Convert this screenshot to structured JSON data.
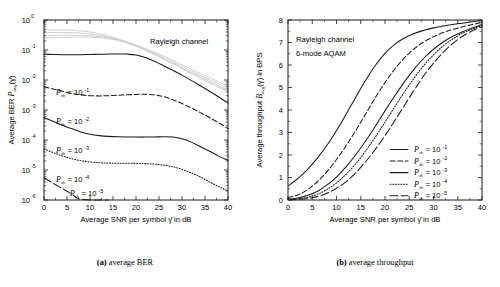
{
  "figure": {
    "panels": [
      {
        "id": "a",
        "caption_tag": "(a)",
        "caption_text": " average BER",
        "annotations": [
          "Rayleigh channel"
        ],
        "chart_data": {
          "type": "line",
          "title": "",
          "xlabel": "Average SNR per symbol γ̄  in dB",
          "ylabel": "Average BER Pₐᵥᵍ(γ̄)",
          "xlim": [
            0,
            40
          ],
          "ylim": [
            1e-06,
            1
          ],
          "yscale": "log",
          "grid": false,
          "xticks": [
            0,
            5,
            10,
            15,
            20,
            25,
            30,
            35,
            40
          ],
          "xticklabels": [
            "0",
            "5",
            "10",
            "15",
            "20",
            "25",
            "30",
            "35",
            "40"
          ],
          "yticks": [
            1,
            0.1,
            0.01,
            0.001,
            0.0001,
            1e-05,
            1e-06
          ],
          "yticklabels": [
            "10^0",
            "10^-1",
            "10^-2",
            "10^-3",
            "10^-4",
            "10^-5",
            "10^-6"
          ],
          "legend_position": "inline-labels",
          "series": [
            {
              "name": "Pth = 10^-1",
              "label_base": "P",
              "label_sub": "th",
              "label_eq": "= 10",
              "label_exp": "-1",
              "style": "solid",
              "x": [
                0,
                2,
                4,
                6,
                8,
                10,
                12,
                14,
                16,
                18,
                20,
                22,
                24,
                26,
                28,
                30,
                32,
                34,
                36,
                38,
                40
              ],
              "y": [
                0.072,
                0.071,
                0.07,
                0.07,
                0.07,
                0.071,
                0.072,
                0.073,
                0.074,
                0.073,
                0.068,
                0.056,
                0.042,
                0.03,
                0.021,
                0.0145,
                0.0097,
                0.0064,
                0.0042,
                0.0027,
                0.0017
              ]
            },
            {
              "name": "Pth = 10^-2",
              "label_base": "P",
              "label_sub": "th",
              "label_eq": "= 10",
              "label_exp": "-2",
              "style": "dashed",
              "x": [
                0,
                2,
                4,
                6,
                8,
                10,
                12,
                14,
                16,
                18,
                20,
                22,
                24,
                26,
                28,
                30,
                32,
                34,
                36,
                38,
                40
              ],
              "y": [
                0.006,
                0.005,
                0.0042,
                0.0036,
                0.0032,
                0.003,
                0.00295,
                0.003,
                0.0031,
                0.0032,
                0.0033,
                0.00335,
                0.0032,
                0.0028,
                0.0022,
                0.00165,
                0.00118,
                0.00082,
                0.00056,
                0.00037,
                0.00024
              ]
            },
            {
              "name": "Pth = 10^-3",
              "label_base": "P",
              "label_sub": "th",
              "label_eq": "= 10",
              "label_exp": "-3",
              "style": "solid",
              "x": [
                0,
                2,
                4,
                6,
                8,
                10,
                12,
                14,
                16,
                18,
                20,
                22,
                24,
                26,
                28,
                30,
                32,
                34,
                36,
                38,
                40
              ],
              "y": [
                0.00056,
                0.00042,
                0.00031,
                0.00024,
                0.000185,
                0.000155,
                0.00014,
                0.000132,
                0.000128,
                0.000126,
                0.000125,
                0.000125,
                0.000126,
                0.000128,
                0.000125,
                0.00011,
                8.5e-05,
                6e-05,
                4.2e-05,
                2.9e-05,
                2.1e-05
              ]
            },
            {
              "name": "Pth = 10^-4",
              "label_base": "P",
              "label_sub": "th",
              "label_eq": "= 10",
              "label_exp": "-4",
              "style": "dotted",
              "x": [
                0,
                2,
                4,
                6,
                8,
                10,
                12,
                14,
                16,
                18,
                20,
                22,
                24,
                26,
                28,
                30,
                32,
                34,
                36,
                38,
                40
              ],
              "y": [
                5e-05,
                3.8e-05,
                2.95e-05,
                2.4e-05,
                2.05e-05,
                1.85e-05,
                1.75e-05,
                1.7e-05,
                1.68e-05,
                1.67e-05,
                1.66e-05,
                1.63e-05,
                1.57e-05,
                1.45e-05,
                1.28e-05,
                1.05e-05,
                8e-06,
                5.8e-06,
                4e-06,
                2.8e-06,
                2e-06
              ]
            },
            {
              "name": "Pth = 10^-5",
              "label_base": "P",
              "label_sub": "th",
              "label_eq": "= 10",
              "label_exp": "-5",
              "style": "longdash",
              "x": [
                0,
                2,
                4,
                6,
                8,
                10,
                12,
                14
              ],
              "y": [
                5.5e-06,
                3.6e-06,
                2.4e-06,
                1.6e-06,
                1.05e-06,
                7e-07,
                4.6e-07,
                1e-06
              ]
            }
          ]
        }
      },
      {
        "id": "b",
        "caption_tag": "(b)",
        "caption_text": " average throughput",
        "annotations": [
          "Rayleigh channel",
          "6-mode AQAM"
        ],
        "chart_data": {
          "type": "line",
          "title": "",
          "xlabel": "Average SNR per symbol γ̄  in dB",
          "ylabel": "Average throughput Bₐᵥᵍ(γ̄) in BPS",
          "xlim": [
            0,
            40
          ],
          "ylim": [
            0,
            8
          ],
          "yscale": "linear",
          "grid": false,
          "xticks": [
            0,
            5,
            10,
            15,
            20,
            25,
            30,
            35,
            40
          ],
          "xticklabels": [
            "0",
            "5",
            "10",
            "15",
            "20",
            "25",
            "30",
            "35",
            "40"
          ],
          "yticks": [
            0,
            1,
            2,
            3,
            4,
            5,
            6,
            7,
            8
          ],
          "yticklabels": [
            "0",
            "1",
            "2",
            "3",
            "4",
            "5",
            "6",
            "7",
            "8"
          ],
          "legend_position": "lower-right",
          "series": [
            {
              "name": "Pth = 10^-1",
              "label_base": "P",
              "label_sub": "th",
              "label_eq": "= 10",
              "label_exp": "-1",
              "style": "solid",
              "x": [
                0,
                2,
                4,
                6,
                8,
                10,
                12,
                14,
                16,
                18,
                20,
                22,
                24,
                26,
                28,
                30,
                32,
                34,
                36,
                38,
                40
              ],
              "y": [
                0.62,
                0.95,
                1.35,
                1.85,
                2.42,
                3.08,
                3.82,
                4.58,
                5.32,
                5.98,
                6.52,
                6.92,
                7.2,
                7.4,
                7.54,
                7.65,
                7.73,
                7.8,
                7.86,
                7.92,
                7.97
              ]
            },
            {
              "name": "Pth = 10^-2",
              "label_base": "P",
              "label_sub": "th",
              "label_eq": "= 10",
              "label_exp": "-2",
              "style": "dashed",
              "x": [
                0,
                2,
                4,
                6,
                8,
                10,
                12,
                14,
                16,
                18,
                20,
                22,
                24,
                26,
                28,
                30,
                32,
                34,
                36,
                38,
                40
              ],
              "y": [
                0.1,
                0.22,
                0.45,
                0.8,
                1.25,
                1.8,
                2.42,
                3.1,
                3.82,
                4.55,
                5.22,
                5.82,
                6.32,
                6.72,
                7.03,
                7.26,
                7.44,
                7.58,
                7.7,
                7.8,
                7.9
              ]
            },
            {
              "name": "Pth = 10^-3",
              "label_base": "P",
              "label_sub": "th",
              "label_eq": "= 10",
              "label_exp": "-3",
              "style": "solid",
              "x": [
                0,
                2,
                4,
                6,
                8,
                10,
                12,
                14,
                16,
                18,
                20,
                22,
                24,
                26,
                28,
                30,
                32,
                34,
                36,
                38,
                40
              ],
              "y": [
                0.04,
                0.09,
                0.2,
                0.38,
                0.66,
                1.02,
                1.48,
                2.02,
                2.62,
                3.28,
                3.96,
                4.62,
                5.25,
                5.82,
                6.3,
                6.7,
                7.02,
                7.28,
                7.48,
                7.64,
                7.8
              ]
            },
            {
              "name": "Pth = 10^-4",
              "label_base": "P",
              "label_sub": "th",
              "label_eq": "= 10",
              "label_exp": "-4",
              "style": "dotted",
              "x": [
                0,
                2,
                4,
                6,
                8,
                10,
                12,
                14,
                16,
                18,
                20,
                22,
                24,
                26,
                28,
                30,
                32,
                34,
                36,
                38,
                40
              ],
              "y": [
                0.02,
                0.05,
                0.12,
                0.25,
                0.46,
                0.76,
                1.15,
                1.62,
                2.18,
                2.8,
                3.46,
                4.14,
                4.8,
                5.42,
                5.98,
                6.45,
                6.85,
                7.16,
                7.42,
                7.6,
                7.75
              ]
            },
            {
              "name": "Pth = 10^-5",
              "label_base": "P",
              "label_sub": "th",
              "label_eq": "= 10",
              "label_exp": "-5",
              "style": "longdash",
              "x": [
                0,
                2,
                4,
                6,
                8,
                10,
                12,
                14,
                16,
                18,
                20,
                22,
                24,
                26,
                28,
                30,
                32,
                34,
                36,
                38,
                40
              ],
              "y": [
                0.01,
                0.03,
                0.07,
                0.15,
                0.3,
                0.52,
                0.82,
                1.22,
                1.7,
                2.25,
                2.86,
                3.52,
                4.2,
                4.88,
                5.52,
                6.08,
                6.56,
                6.96,
                7.28,
                7.52,
                7.7
              ]
            }
          ]
        }
      }
    ]
  }
}
